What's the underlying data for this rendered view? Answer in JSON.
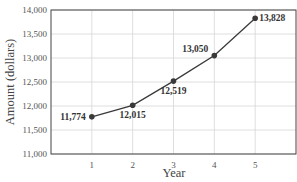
{
  "chart_data": {
    "type": "line",
    "title": "",
    "xlabel": "Year",
    "ylabel": "Amount (dollars)",
    "x": [
      1,
      2,
      3,
      4,
      5
    ],
    "categories": [
      "1",
      "2",
      "3",
      "4",
      "5"
    ],
    "series": [
      {
        "name": "Amount",
        "values": [
          11774,
          12015,
          12519,
          13050,
          13828
        ]
      }
    ],
    "data_labels": [
      "11,774",
      "12,015",
      "12,519",
      "13,050",
      "13,828"
    ],
    "y_ticks": [
      "11,000",
      "11,500",
      "12,000",
      "12,500",
      "13,000",
      "13,500",
      "14,000"
    ],
    "ylim": [
      11000,
      14000
    ],
    "xlim": [
      0,
      6
    ],
    "grid": true,
    "legend": "none",
    "line_color": "#3a3a3a"
  }
}
